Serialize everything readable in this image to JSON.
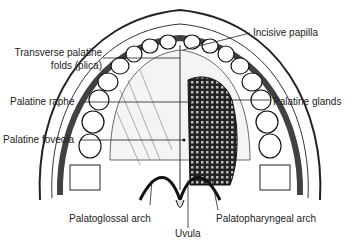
{
  "figure": {
    "labels": {
      "incisive_papilla": "Incisive papilla",
      "transverse_folds_1": "Transverse palatine",
      "transverse_folds_2": "folds (plica)",
      "palatine_raphe": "Palatine raphe",
      "palatine_glands": "Palatine glands",
      "palatine_foveola": "Palatine foveola",
      "palatoglossal_arch": "Palatoglossal arch",
      "uvula": "Uvula",
      "palatopharyngeal_arch": "Palatopharyngeal arch"
    }
  }
}
